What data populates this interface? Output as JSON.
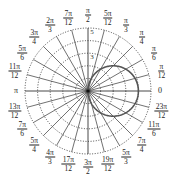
{
  "chart_data": {
    "type": "line",
    "subtype": "polar",
    "title": "",
    "curve": {
      "equation": "r = 4cos(theta)",
      "color": "#555555",
      "line_width": 1.6,
      "description": "circle through origin, centered on positive x-axis, max r = 4"
    },
    "radial_axis": {
      "rings": [
        1,
        2,
        3,
        4,
        5
      ],
      "ring_style": "dotted",
      "tick_labels_visible": [
        "3",
        "5"
      ],
      "rmax": 5
    },
    "angular_axis": {
      "spoke_step": "pi/12",
      "spoke_count": 24,
      "labels": [
        {
          "num": "",
          "den": "",
          "text": "0",
          "deg": 0
        },
        {
          "num": "π",
          "den": "12",
          "deg": 15
        },
        {
          "num": "π",
          "den": "6",
          "deg": 30
        },
        {
          "num": "π",
          "den": "4",
          "deg": 45
        },
        {
          "num": "π",
          "den": "3",
          "deg": 60
        },
        {
          "num": "5π",
          "den": "12",
          "deg": 75
        },
        {
          "num": "π",
          "den": "2",
          "deg": 90
        },
        {
          "num": "7π",
          "den": "12",
          "deg": 105
        },
        {
          "num": "2π",
          "den": "3",
          "deg": 120
        },
        {
          "num": "3π",
          "den": "4",
          "deg": 135
        },
        {
          "num": "5π",
          "den": "6",
          "deg": 150
        },
        {
          "num": "11π",
          "den": "12",
          "deg": 165
        },
        {
          "num": "",
          "den": "",
          "text": "π",
          "deg": 180
        },
        {
          "num": "13π",
          "den": "12",
          "deg": 195
        },
        {
          "num": "7π",
          "den": "6",
          "deg": 210
        },
        {
          "num": "5π",
          "den": "4",
          "deg": 225
        },
        {
          "num": "4π",
          "den": "3",
          "deg": 240
        },
        {
          "num": "17π",
          "den": "12",
          "deg": 255
        },
        {
          "num": "3π",
          "den": "2",
          "deg": 270
        },
        {
          "num": "19π",
          "den": "12",
          "deg": 285
        },
        {
          "num": "5π",
          "den": "3",
          "deg": 300
        },
        {
          "num": "7π",
          "den": "4",
          "deg": 315
        },
        {
          "num": "11π",
          "den": "6",
          "deg": 330
        },
        {
          "num": "23π",
          "den": "12",
          "deg": 345
        }
      ]
    },
    "grid": true,
    "legend": null
  },
  "colors": {
    "spokes": "#333333",
    "rings": "#333333",
    "curve": "#555555",
    "labels": "#222222"
  }
}
